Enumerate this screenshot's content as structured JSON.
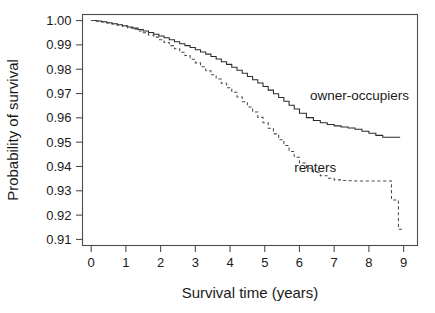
{
  "chart_data": {
    "type": "line",
    "title": "",
    "subtitle": "",
    "xlabel": "Survival time (years)",
    "ylabel": "Probability of survival",
    "xlim": [
      -0.25,
      9.4
    ],
    "ylim": [
      0.9075,
      1.0025
    ],
    "grid": false,
    "legend_position": "inline-annotations",
    "xticks": [
      "0",
      "1",
      "2",
      "3",
      "4",
      "5",
      "6",
      "7",
      "8",
      "9"
    ],
    "xtick_values": [
      0,
      1,
      2,
      3,
      4,
      5,
      6,
      7,
      8,
      9
    ],
    "yticks": [
      "1.00",
      "0.99",
      "0.98",
      "0.97",
      "0.96",
      "0.95",
      "0.94",
      "0.93",
      "0.92",
      "0.91"
    ],
    "ytick_values": [
      1.0,
      0.99,
      0.98,
      0.97,
      0.96,
      0.95,
      0.94,
      0.93,
      0.92,
      0.91
    ],
    "annotations": [
      {
        "text": "owner-occupiers",
        "x": 6.3,
        "y": 0.9672
      },
      {
        "text": "renters",
        "x": 5.85,
        "y": 0.9377
      }
    ],
    "series": [
      {
        "name": "owner-occupiers",
        "style": "solid",
        "color": "#2b2b2b",
        "x": [
          0.0,
          0.15,
          0.3,
          0.45,
          0.6,
          0.75,
          0.9,
          1.05,
          1.2,
          1.35,
          1.5,
          1.65,
          1.8,
          1.95,
          2.1,
          2.25,
          2.4,
          2.55,
          2.7,
          2.85,
          3.0,
          3.15,
          3.3,
          3.45,
          3.6,
          3.75,
          3.9,
          4.05,
          4.2,
          4.35,
          4.5,
          4.65,
          4.8,
          4.95,
          5.1,
          5.25,
          5.4,
          5.55,
          5.7,
          5.85,
          6.0,
          6.2,
          6.4,
          6.6,
          6.8,
          7.0,
          7.2,
          7.4,
          7.6,
          7.8,
          8.0,
          8.2,
          8.4,
          8.6,
          8.75,
          8.9
        ],
        "y": [
          1.0,
          0.9998,
          0.9995,
          0.9991,
          0.9987,
          0.9983,
          0.9979,
          0.9974,
          0.9969,
          0.9963,
          0.9957,
          0.9951,
          0.9944,
          0.9937,
          0.9929,
          0.9921,
          0.9913,
          0.9905,
          0.9897,
          0.9889,
          0.988,
          0.9871,
          0.9862,
          0.9852,
          0.9842,
          0.9831,
          0.982,
          0.9808,
          0.9796,
          0.9783,
          0.977,
          0.9757,
          0.9743,
          0.9729,
          0.9714,
          0.9699,
          0.9684,
          0.9668,
          0.9652,
          0.9636,
          0.9619,
          0.9601,
          0.9589,
          0.958,
          0.9573,
          0.9567,
          0.9562,
          0.9558,
          0.9553,
          0.9545,
          0.9537,
          0.9528,
          0.952,
          0.952,
          0.952,
          0.952
        ]
      },
      {
        "name": "renters",
        "style": "dashed",
        "color": "#4a4a4a",
        "x": [
          0.0,
          0.15,
          0.3,
          0.45,
          0.6,
          0.75,
          0.9,
          1.05,
          1.2,
          1.35,
          1.5,
          1.65,
          1.8,
          1.95,
          2.1,
          2.25,
          2.4,
          2.55,
          2.7,
          2.85,
          3.0,
          3.15,
          3.3,
          3.45,
          3.6,
          3.75,
          3.9,
          4.05,
          4.2,
          4.35,
          4.5,
          4.65,
          4.8,
          4.95,
          5.1,
          5.25,
          5.4,
          5.55,
          5.7,
          5.85,
          6.0,
          6.2,
          6.4,
          6.6,
          6.8,
          7.0,
          7.2,
          7.4,
          7.6,
          7.8,
          8.0,
          8.2,
          8.4,
          8.6,
          8.65,
          8.8,
          8.85,
          9.0
        ],
        "y": [
          1.0,
          0.9997,
          0.9994,
          0.999,
          0.9986,
          0.9981,
          0.9976,
          0.997,
          0.9964,
          0.9957,
          0.995,
          0.9941,
          0.9932,
          0.9921,
          0.991,
          0.9897,
          0.9884,
          0.987,
          0.9856,
          0.9841,
          0.9826,
          0.981,
          0.9794,
          0.9777,
          0.976,
          0.9742,
          0.9724,
          0.9705,
          0.9686,
          0.9666,
          0.9645,
          0.9624,
          0.9602,
          0.958,
          0.9557,
          0.9534,
          0.951,
          0.9486,
          0.9462,
          0.9438,
          0.9414,
          0.9393,
          0.9376,
          0.9362,
          0.9352,
          0.9345,
          0.9342,
          0.9341,
          0.934,
          0.934,
          0.934,
          0.934,
          0.934,
          0.934,
          0.9262,
          0.9262,
          0.9142,
          0.9142
        ]
      }
    ]
  },
  "axes": {
    "y_axis_label": "Probability of survival",
    "x_axis_label": "Survival time (years)"
  }
}
